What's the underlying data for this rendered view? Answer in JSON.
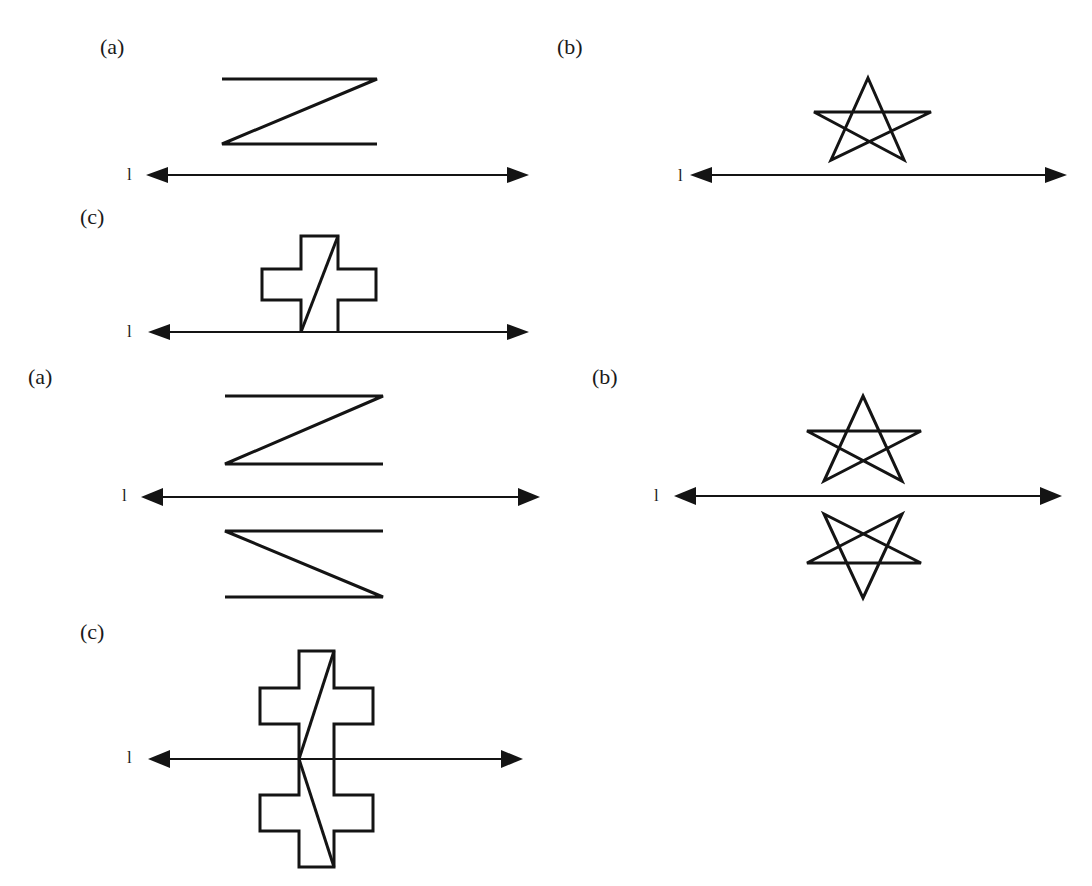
{
  "figure": {
    "top_set": {
      "panels": [
        {
          "id": "a",
          "label": "(a)",
          "axis_label": "l",
          "shape": "Z-shape",
          "reflected": false
        },
        {
          "id": "b",
          "label": "(b)",
          "axis_label": "l",
          "shape": "pentagram star",
          "reflected": false
        },
        {
          "id": "c",
          "label": "(c)",
          "axis_label": "l",
          "shape": "cross with diagonal",
          "reflected": false
        }
      ]
    },
    "bottom_set": {
      "panels": [
        {
          "id": "a",
          "label": "(a)",
          "axis_label": "l",
          "shape": "Z-shape with mirror image",
          "reflected": true
        },
        {
          "id": "b",
          "label": "(b)",
          "axis_label": "l",
          "shape": "pentagram star with mirror image",
          "reflected": true
        },
        {
          "id": "c",
          "label": "(c)",
          "axis_label": "l",
          "shape": "cross with diagonal and mirror image",
          "reflected": true
        }
      ]
    },
    "colors": {
      "ink": "#141414",
      "background": "#ffffff"
    }
  }
}
